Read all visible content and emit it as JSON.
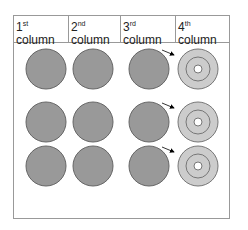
{
  "headers": [
    {
      "num": "1",
      "suffix": "st",
      "word": "column"
    },
    {
      "num": "2",
      "suffix": "nd",
      "word": "column"
    },
    {
      "num": "3",
      "suffix": "rd",
      "word": "column"
    },
    {
      "num": "4",
      "suffix": "th",
      "word": "column"
    }
  ],
  "colors": {
    "solid": "#999999",
    "outline": "#666666",
    "ring_light": "#cccccc",
    "border": "#999999"
  },
  "rows": 3
}
